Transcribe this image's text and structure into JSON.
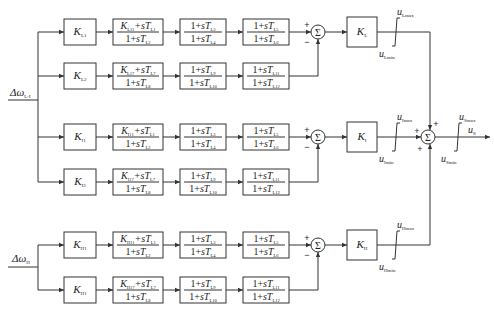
{
  "diagram": {
    "type": "block-diagram",
    "inputs": {
      "L": {
        "symbol": "Δω",
        "sub": "L-I"
      },
      "H": {
        "symbol": "Δω",
        "sub": "H"
      }
    },
    "bands": [
      {
        "id": "L",
        "rows": [
          {
            "gain": {
              "sym": "K",
              "sub": "L1"
            },
            "lead": {
              "num_k": "L11",
              "num_t": "L1",
              "den_t": "L2"
            },
            "b2": {
              "num": "L3",
              "den": "L4"
            },
            "b3": {
              "num": "L5",
              "den": "L6"
            }
          },
          {
            "gain": {
              "sym": "K",
              "sub": "L2"
            },
            "lead": {
              "num_k": "L17",
              "num_t": "L7",
              "den_t": "L8"
            },
            "b2": {
              "num": "L9",
              "den": "L10"
            },
            "b3": {
              "num": "L11",
              "den": "L12"
            }
          }
        ],
        "sum_signs": [
          "+",
          "−"
        ],
        "band_gain": {
          "sym": "K",
          "sub": "L"
        },
        "limiter": {
          "max": "Lmax",
          "min": "Lmin"
        }
      },
      {
        "id": "I",
        "rows": [
          {
            "gain": {
              "sym": "K",
              "sub": "I1"
            },
            "lead": {
              "num_k": "I11",
              "num_t": "L1",
              "den_t": "L2"
            },
            "b2": {
              "num": "L3",
              "den": "L4"
            },
            "b3": {
              "num": "L5",
              "den": "L6"
            }
          },
          {
            "gain": {
              "sym": "K",
              "sub": "I2"
            },
            "lead": {
              "num_k": "I17",
              "num_t": "L7",
              "den_t": "L8"
            },
            "b2": {
              "num": "L9",
              "den": "L10"
            },
            "b3": {
              "num": "L11",
              "den": "L12"
            }
          }
        ],
        "sum_signs": [
          "+",
          "−"
        ],
        "band_gain": {
          "sym": "K",
          "sub": "I"
        },
        "limiter": {
          "max": "Imax",
          "min": "Imin"
        }
      },
      {
        "id": "H",
        "rows": [
          {
            "gain": {
              "sym": "K",
              "sub": "H1"
            },
            "lead": {
              "num_k": "H11",
              "num_t": "L1",
              "den_t": "L2"
            },
            "b2": {
              "num": "L3",
              "den": "L4"
            },
            "b3": {
              "num": "L5",
              "den": "L6"
            }
          },
          {
            "gain": {
              "sym": "K",
              "sub": "H1"
            },
            "lead": {
              "num_k": "H17",
              "num_t": "L7",
              "den_t": "L8"
            },
            "b2": {
              "num": "L9",
              "den": "L10"
            },
            "b3": {
              "num": "L11",
              "den": "L12"
            }
          }
        ],
        "sum_signs": [
          "+",
          "−"
        ],
        "band_gain": {
          "sym": "K",
          "sub": "H"
        },
        "limiter": {
          "max": "Hmax",
          "min": "Hmin"
        }
      }
    ],
    "final_sum": {
      "signs": [
        "+",
        "+",
        "+"
      ]
    },
    "output_limiter": {
      "max": "Smax",
      "min": "Smin"
    },
    "output": {
      "sym": "u",
      "sub": "S"
    },
    "labels": {
      "sigma": "Σ",
      "one_plus_s": "1+s",
      "plus_s": "+s",
      "T": "T",
      "K": "K",
      "u": "u"
    }
  }
}
